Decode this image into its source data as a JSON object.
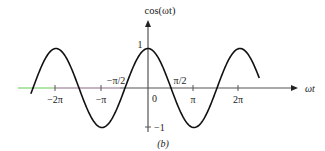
{
  "figure": {
    "y_axis_label": "cos(ωt)",
    "x_axis_label": "ωt",
    "caption": "(b)",
    "origin_label": "0",
    "y_ticks": [
      {
        "label": "1",
        "value": 1
      },
      {
        "label": "−1",
        "value": -1
      }
    ],
    "x_ticks": [
      {
        "label": "−2π",
        "value": -6.2832
      },
      {
        "label": "−π",
        "value": -3.1416
      },
      {
        "label": "π",
        "value": 3.1416
      },
      {
        "label": "2π",
        "value": 6.2832
      }
    ],
    "annotations": [
      {
        "label": "−π/2",
        "value": -1.5708
      },
      {
        "label": "π/2",
        "value": 1.5708
      }
    ],
    "colors": {
      "curve": "#111111",
      "axis": "#555555",
      "axis_left_green": "#66cc55",
      "axis_left_purple": "#8a6a8a"
    }
  },
  "chart_data": {
    "type": "line",
    "title": "",
    "xlabel": "ωt",
    "ylabel": "cos(ωt)",
    "function": "cos(ωt)",
    "x_range": [
      -8.0,
      7.6
    ],
    "ylim": [
      -1,
      1
    ],
    "x": [
      -7.854,
      -6.283,
      -4.712,
      -3.142,
      -1.571,
      0,
      1.571,
      3.142,
      4.712,
      6.283,
      7.854
    ],
    "values": [
      0,
      1,
      0,
      -1,
      0,
      1,
      0,
      -1,
      0,
      1,
      0
    ],
    "x_tick_labels": [
      "−2π",
      "−π",
      "0",
      "π",
      "2π"
    ],
    "y_tick_labels": [
      "1",
      "−1"
    ],
    "annotations": [
      "−π/2",
      "π/2"
    ],
    "caption": "(b)"
  }
}
